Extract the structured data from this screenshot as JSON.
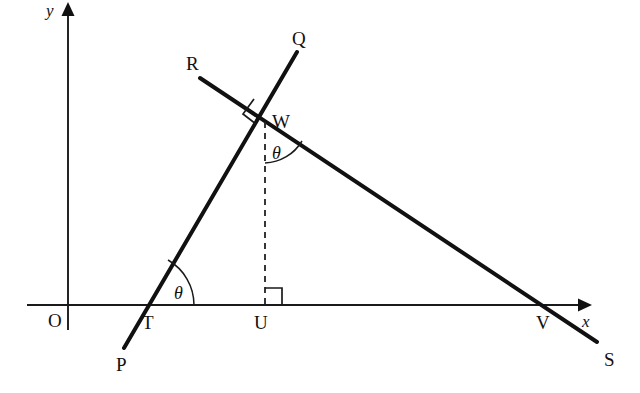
{
  "figure": {
    "background_color": "#ffffff",
    "stroke_color": "#111111",
    "width": 640,
    "height": 393
  },
  "axes": {
    "x_axis": {
      "label": "x",
      "label_x": 585,
      "label_y": 325,
      "y": 305,
      "x_start": 27,
      "x_end": 588,
      "arrow": "right"
    },
    "y_axis": {
      "label": "y",
      "label_x": 50,
      "label_y": 14,
      "x": 68,
      "y_start": 330,
      "y_end": 6,
      "arrow": "up"
    },
    "origin": {
      "label": "O",
      "label_x": 48,
      "label_y": 327,
      "x": 68,
      "y": 305
    }
  },
  "points": [
    {
      "name": "P",
      "label": "P",
      "x": 124,
      "y": 348,
      "label_x": 116,
      "label_y": 370
    },
    {
      "name": "Q",
      "label": "Q",
      "x": 297,
      "y": 52,
      "label_x": 294,
      "label_y": 45
    },
    {
      "name": "R",
      "label": "R",
      "x": 200,
      "y": 78,
      "label_x": 186,
      "label_y": 70
    },
    {
      "name": "S",
      "label": "S",
      "x": 597,
      "y": 342,
      "label_x": 604,
      "label_y": 366
    },
    {
      "name": "T",
      "label": "T",
      "x": 142,
      "y": 305,
      "label_x": 143,
      "label_y": 328
    },
    {
      "name": "U",
      "label": "U",
      "x": 265,
      "y": 305,
      "label_x": 256,
      "label_y": 328
    },
    {
      "name": "V",
      "label": "V",
      "x": 551,
      "y": 305,
      "label_x": 537,
      "label_y": 328
    },
    {
      "name": "W",
      "label": "W",
      "x": 265,
      "y": 118,
      "label_x": 273,
      "label_y": 127
    }
  ],
  "lines": [
    {
      "name": "line-PQ",
      "from": "P",
      "to": "Q",
      "x1": 124,
      "y1": 348,
      "x2": 297,
      "y2": 52
    },
    {
      "name": "line-RS",
      "from": "R",
      "to": "S",
      "x1": 200,
      "y1": 78,
      "x2": 597,
      "y2": 342
    },
    {
      "name": "segment-WU-dashed",
      "from": "W",
      "to": "U",
      "x1": 265,
      "y1": 120,
      "x2": 265,
      "y2": 305,
      "style": "dashed"
    }
  ],
  "angles": [
    {
      "name": "angle-theta-at-T",
      "label": "θ",
      "vertex": "T",
      "vertex_x": 142,
      "vertex_y": 305,
      "label_x": 175,
      "label_y": 298,
      "between": [
        "x-axis",
        "ray TQ"
      ]
    },
    {
      "name": "angle-theta-at-W",
      "label": "θ",
      "vertex": "W",
      "vertex_x": 265,
      "vertex_y": 118,
      "label_x": 271,
      "label_y": 158,
      "between": [
        "segment WU",
        "ray WS"
      ]
    }
  ],
  "right_angles": [
    {
      "name": "right-angle-at-W",
      "vertex": "W",
      "vertex_x": 265,
      "vertex_y": 118,
      "between": [
        "ray WQ",
        "ray WR"
      ]
    },
    {
      "name": "right-angle-at-U",
      "vertex": "U",
      "vertex_x": 265,
      "vertex_y": 305,
      "between": [
        "segment UW",
        "x-axis"
      ]
    }
  ]
}
